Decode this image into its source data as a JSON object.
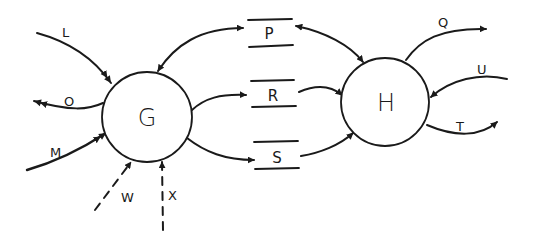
{
  "diagram": {
    "type": "data-flow-diagram",
    "colors": {
      "ink": "#1a1a1a",
      "background": "#ffffff"
    },
    "processes": [
      {
        "id": "G",
        "label": "G"
      },
      {
        "id": "H",
        "label": "H"
      }
    ],
    "stores": [
      {
        "id": "P",
        "label": "P"
      },
      {
        "id": "R",
        "label": "R"
      },
      {
        "id": "S",
        "label": "S"
      }
    ],
    "flows": [
      {
        "label": "L",
        "from": "external",
        "to": "G",
        "style": "solid",
        "arrow": "double"
      },
      {
        "label": "O",
        "from": "G",
        "to": "external",
        "style": "solid",
        "arrow": "double"
      },
      {
        "label": "M",
        "from": "external",
        "to": "G",
        "style": "solid",
        "arrow": "double"
      },
      {
        "label": "W",
        "from": "external",
        "to": "G",
        "style": "dashed",
        "arrow": "single"
      },
      {
        "label": "X",
        "from": "external",
        "to": "G",
        "style": "dashed",
        "arrow": "single"
      },
      {
        "label": "",
        "from": "G",
        "to": "P",
        "style": "solid",
        "arrow": "bidirectional"
      },
      {
        "label": "",
        "from": "G",
        "to": "R",
        "style": "solid",
        "arrow": "single"
      },
      {
        "label": "",
        "from": "G",
        "to": "S",
        "style": "solid",
        "arrow": "single"
      },
      {
        "label": "",
        "from": "P",
        "to": "H",
        "style": "solid",
        "arrow": "bidirectional"
      },
      {
        "label": "",
        "from": "R",
        "to": "H",
        "style": "solid",
        "arrow": "single"
      },
      {
        "label": "",
        "from": "S",
        "to": "H",
        "style": "solid",
        "arrow": "single"
      },
      {
        "label": "Q",
        "from": "H",
        "to": "external",
        "style": "solid",
        "arrow": "single"
      },
      {
        "label": "U",
        "from": "external",
        "to": "H",
        "style": "solid",
        "arrow": "single"
      },
      {
        "label": "T",
        "from": "H",
        "to": "external",
        "style": "solid",
        "arrow": "single"
      }
    ],
    "labels": {
      "G": "G",
      "H": "H",
      "P": "P",
      "R": "R",
      "S": "S",
      "L": "L",
      "O": "O",
      "M": "M",
      "W": "W",
      "X": "X",
      "Q": "Q",
      "U": "U",
      "T": "T"
    }
  }
}
